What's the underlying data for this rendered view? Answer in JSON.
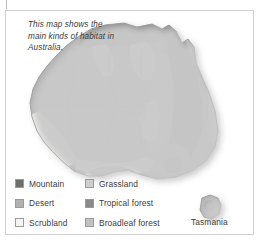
{
  "figure": {
    "caption": "This map shows the main kinds of habitat in Australia.",
    "tasmania_label": "Tasmania"
  },
  "legend": {
    "items": [
      {
        "label": "Mountain",
        "key": "mountain",
        "color": "#6e6e6e"
      },
      {
        "label": "Grassland",
        "key": "grassland",
        "color": "#cfcfcf"
      },
      {
        "label": "Desert",
        "key": "desert",
        "color": "#b0b0b0"
      },
      {
        "label": "Tropical forest",
        "key": "tropical-forest",
        "color": "#8a8a8a"
      },
      {
        "label": "Scrubland",
        "key": "scrubland",
        "color": "#f4f4f2"
      },
      {
        "label": "Broadleaf forest",
        "key": "broadleaf-forest",
        "color": "#c2c2c2"
      }
    ]
  },
  "map": {
    "title": "Australia habitat map",
    "regions": [
      {
        "name": "northern-tropical-forest",
        "habitat": "Tropical forest"
      },
      {
        "name": "eastern-mountain-range",
        "habitat": "Mountain"
      },
      {
        "name": "central-desert",
        "habitat": "Desert"
      },
      {
        "name": "northern-scrubland",
        "habitat": "Scrubland"
      },
      {
        "name": "southwest-scrubland",
        "habitat": "Scrubland"
      },
      {
        "name": "eastern-grassland",
        "habitat": "Grassland"
      },
      {
        "name": "southeast-broadleaf",
        "habitat": "Broadleaf forest"
      },
      {
        "name": "tasmania-island",
        "habitat": "Broadleaf forest"
      }
    ],
    "colors": {
      "mountain": "#6e6e6e",
      "grassland": "#cfcfcf",
      "desert": "#b0b0b0",
      "tropical_forest": "#8a8a8a",
      "scrubland": "#f4f4f2",
      "broadleaf_forest": "#c2c2c2",
      "sea": "#ffffff",
      "outline": "#8e8e8e",
      "shadow": "#d8d8d8"
    }
  }
}
